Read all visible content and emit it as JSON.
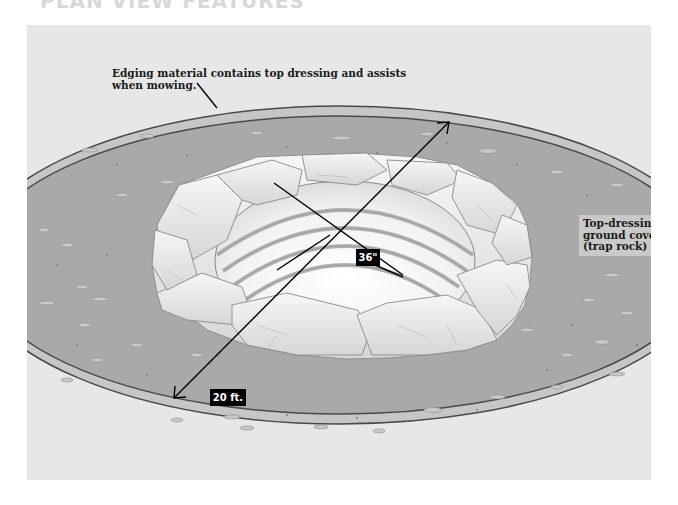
{
  "title": "PLAN VIEW FEATURES",
  "diagram": {
    "callouts": {
      "edging": "Edging material contains top dressing and assists when mowing.",
      "top_dressing_line1": "Top-dressing",
      "top_dressing_line2": "ground cover",
      "top_dressing_line3": "(trap rock)"
    },
    "dimensions": {
      "pit_diameter": "36\"",
      "area_diameter": "20 ft."
    },
    "colors": {
      "panel_bg": "#e7e7e7",
      "ground_cover": "#a9a9a9",
      "edging_band": "#c6c6c6",
      "stone": "#ececec",
      "stone_outline": "#8a8a8a",
      "ring": "#b5b5b5",
      "label_bg": "#000000",
      "label_text": "#ffffff"
    }
  }
}
